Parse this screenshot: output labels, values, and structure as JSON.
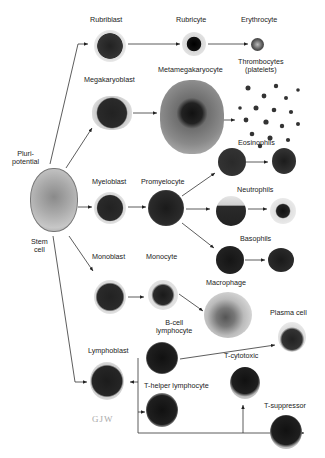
{
  "diagram": {
    "signature": "GJW",
    "nodes": {
      "stem_cell_top": "Pluri-",
      "stem_cell_top2": "potential",
      "stem_cell_bottom": "Stem",
      "stem_cell_bottom2": "cell",
      "rubriblast": "Rubriblast",
      "rubricyte": "Rubricyte",
      "erythrocyte": "Erythrocyte",
      "megakaryoblast": "Megakaryoblast",
      "metamegakaryocyte": "Metamegakaryocyte",
      "thrombocytes": "Thrombocytes",
      "thrombocytes2": "(platelets)",
      "myeloblast": "Myeloblast",
      "promyelocyte": "Promyelocyte",
      "eosinophils": "Eosinophils",
      "neutrophils": "Neutrophils",
      "basophils": "Basophils",
      "monoblast": "Monoblast",
      "monocyte": "Monocyte",
      "macrophage": "Macrophage",
      "bcell": "B-cell",
      "bcell2": "lymphocyte",
      "plasma_cell": "Plasma cell",
      "lymphoblast": "Lymphoblast",
      "thelper": "T-helper lymphocyte",
      "tcytotoxic": "T-cytotoxic",
      "tsuppressor": "T-suppressor"
    },
    "edges": [
      [
        "Pluripotential stem cell",
        "Rubriblast"
      ],
      [
        "Rubriblast",
        "Rubricyte"
      ],
      [
        "Rubricyte",
        "Erythrocyte"
      ],
      [
        "Pluripotential stem cell",
        "Megakaryoblast"
      ],
      [
        "Megakaryoblast",
        "Metamegakaryocyte"
      ],
      [
        "Metamegakaryocyte",
        "Thrombocytes (platelets)"
      ],
      [
        "Pluripotential stem cell",
        "Myeloblast"
      ],
      [
        "Myeloblast",
        "Promyelocyte"
      ],
      [
        "Promyelocyte",
        "Eosinophils"
      ],
      [
        "Promyelocyte",
        "Neutrophils"
      ],
      [
        "Promyelocyte",
        "Basophils"
      ],
      [
        "Pluripotential stem cell",
        "Monoblast"
      ],
      [
        "Monoblast",
        "Monocyte"
      ],
      [
        "Monocyte",
        "Macrophage"
      ],
      [
        "Pluripotential stem cell",
        "Lymphoblast"
      ],
      [
        "Lymphoblast",
        "B-cell lymphocyte"
      ],
      [
        "B-cell lymphocyte",
        "Plasma cell"
      ],
      [
        "Lymphoblast",
        "T-helper lymphocyte"
      ],
      [
        "Lymphoblast",
        "T-cytotoxic"
      ],
      [
        "Lymphoblast",
        "T-suppressor"
      ]
    ]
  }
}
